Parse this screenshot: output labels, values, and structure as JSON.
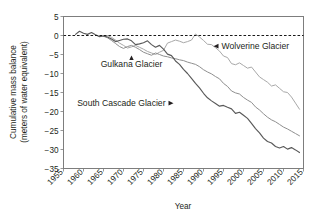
{
  "chart_data": {
    "type": "line",
    "title": "",
    "xlabel": "Year",
    "ylabel_line1": "Cumulative mass balance",
    "ylabel_line2": "(meters of water equivalent)",
    "xlim": [
      1955,
      2015
    ],
    "ylim": [
      -35,
      5
    ],
    "xticks": [
      1955,
      1960,
      1965,
      1970,
      1975,
      1980,
      1985,
      1990,
      1995,
      2000,
      2005,
      2010,
      2015
    ],
    "yticks": [
      5,
      0,
      -5,
      -10,
      -15,
      -20,
      -25,
      -30,
      -35
    ],
    "grid": true,
    "legend_position": "inline-annotations",
    "reference_line": {
      "value": 0,
      "style": "dashed",
      "color": "#1a1a1a"
    },
    "colors": {
      "wolverine": "#a8a8a8",
      "gulkana": "#8f8f8f",
      "south_cascade": "#595959",
      "grid": "#d9dadb",
      "frame": "#7d7d7d",
      "text": "#231f20"
    },
    "annotations": [
      {
        "label": "Wolverine Glacier",
        "arrow": "left",
        "x": 1993,
        "y": -2.8
      },
      {
        "label": "Gulkana Glacier",
        "arrow": "up",
        "x": 1972,
        "y": -7.4
      },
      {
        "label": "South Cascade Glacier",
        "arrow": "right",
        "x": 1982,
        "y": -17.8
      }
    ],
    "series": [
      {
        "name": "Wolverine Glacier",
        "color": "#a8a8a8",
        "x": [
          1966,
          1967,
          1968,
          1969,
          1970,
          1971,
          1972,
          1973,
          1974,
          1975,
          1976,
          1977,
          1978,
          1979,
          1980,
          1981,
          1982,
          1983,
          1984,
          1985,
          1986,
          1987,
          1988,
          1989,
          1990,
          1991,
          1992,
          1993,
          1994,
          1995,
          1996,
          1997,
          1998,
          1999,
          2000,
          2001,
          2002,
          2003,
          2004,
          2005,
          2006,
          2007,
          2008,
          2009,
          2010,
          2011,
          2012,
          2013,
          2014
        ],
        "values": [
          0.0,
          -0.5,
          -1.2,
          -2.0,
          -2.6,
          -3.3,
          -3.0,
          -2.6,
          -3.1,
          -3.6,
          -4.2,
          -4.6,
          -5.0,
          -4.4,
          -3.9,
          -2.0,
          -1.6,
          -1.2,
          -1.5,
          -1.9,
          -1.6,
          -1.2,
          0.4,
          -0.4,
          -1.3,
          -2.3,
          -2.4,
          -3.2,
          -4.1,
          -5.4,
          -5.8,
          -7.4,
          -7.7,
          -7.2,
          -7.9,
          -8.6,
          -8.3,
          -9.6,
          -10.9,
          -11.6,
          -12.3,
          -13.3,
          -13.0,
          -13.9,
          -14.8,
          -15.0,
          -16.2,
          -17.8,
          -19.4
        ]
      },
      {
        "name": "Gulkana Glacier",
        "color": "#8f8f8f",
        "x": [
          1965,
          1966,
          1967,
          1968,
          1969,
          1970,
          1971,
          1972,
          1973,
          1974,
          1975,
          1976,
          1977,
          1978,
          1979,
          1980,
          1981,
          1982,
          1983,
          1984,
          1985,
          1986,
          1987,
          1988,
          1989,
          1990,
          1991,
          1992,
          1993,
          1994,
          1995,
          1996,
          1997,
          1998,
          1999,
          2000,
          2001,
          2002,
          2003,
          2004,
          2005,
          2006,
          2007,
          2008,
          2009,
          2010,
          2011,
          2012,
          2013,
          2014
        ],
        "values": [
          -0.2,
          -0.6,
          -1.3,
          -2.1,
          -2.9,
          -3.4,
          -2.9,
          -2.6,
          -3.1,
          -3.7,
          -4.4,
          -4.8,
          -5.2,
          -4.6,
          -5.0,
          -5.4,
          -5.6,
          -5.9,
          -6.1,
          -6.4,
          -6.6,
          -7.0,
          -7.3,
          -7.6,
          -8.2,
          -9.0,
          -9.6,
          -10.1,
          -10.8,
          -11.4,
          -12.6,
          -13.4,
          -14.6,
          -15.1,
          -15.4,
          -16.3,
          -17.0,
          -17.6,
          -18.8,
          -19.6,
          -20.6,
          -21.5,
          -22.2,
          -22.7,
          -23.4,
          -24.1,
          -24.6,
          -25.2,
          -25.8,
          -26.4
        ]
      },
      {
        "name": "South Cascade Glacier",
        "color": "#595959",
        "x": [
          1958,
          1959,
          1960,
          1961,
          1962,
          1963,
          1964,
          1965,
          1966,
          1967,
          1968,
          1969,
          1970,
          1971,
          1972,
          1973,
          1974,
          1975,
          1976,
          1977,
          1978,
          1979,
          1980,
          1981,
          1982,
          1983,
          1984,
          1985,
          1986,
          1987,
          1988,
          1989,
          1990,
          1991,
          1992,
          1993,
          1994,
          1995,
          1996,
          1997,
          1998,
          1999,
          2000,
          2001,
          2002,
          2003,
          2004,
          2005,
          2006,
          2007,
          2008,
          2009,
          2010,
          2011,
          2012,
          2013,
          2014
        ],
        "values": [
          0.3,
          1.1,
          0.6,
          0.3,
          0.8,
          0.2,
          -0.3,
          -0.1,
          -0.4,
          -0.9,
          -1.6,
          -1.3,
          -1.0,
          -0.9,
          -1.4,
          -2.4,
          -2.2,
          -1.9,
          -1.4,
          -2.4,
          -3.1,
          -2.6,
          -3.6,
          -4.9,
          -5.3,
          -6.7,
          -7.6,
          -8.9,
          -10.0,
          -11.3,
          -12.6,
          -13.8,
          -15.2,
          -16.4,
          -17.2,
          -17.9,
          -18.6,
          -18.4,
          -18.9,
          -19.3,
          -20.5,
          -20.2,
          -21.0,
          -21.8,
          -23.1,
          -24.5,
          -25.6,
          -27.0,
          -27.9,
          -28.3,
          -29.2,
          -29.6,
          -29.2,
          -29.9,
          -29.5,
          -30.1,
          -30.8
        ]
      }
    ]
  }
}
